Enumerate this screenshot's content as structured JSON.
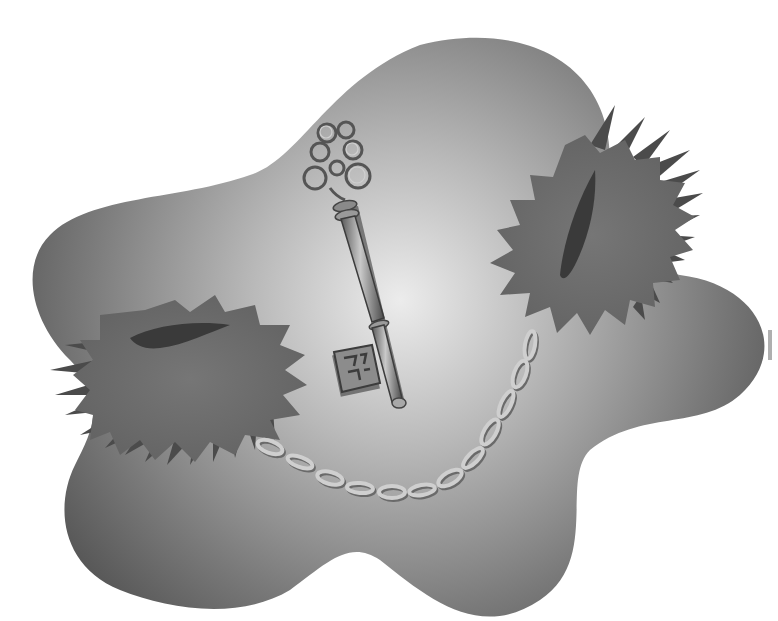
{
  "image": {
    "kind": "grayscale clip-art illustration",
    "width": 778,
    "height": 621,
    "background": "#ffffff"
  },
  "elements": {
    "blob": {
      "name": "gradient-blob",
      "light": "#e6e6e6",
      "mid": "#a6a6a6",
      "dark": "#5a5a5a"
    },
    "key": {
      "name": "skeleton-key",
      "fill": "#8f8f8f",
      "highlight": "#d8d8d8",
      "shadow": "#3c3c3c"
    },
    "hole_left": {
      "name": "spiky-hole-left",
      "fill": "#6e6e6e",
      "spike": "#4a4a4a",
      "slit": "#3a3a3a"
    },
    "hole_right": {
      "name": "spiky-hole-right",
      "fill": "#6e6e6e",
      "spike": "#4a4a4a",
      "slit": "#3a3a3a"
    },
    "chain": {
      "name": "chain",
      "link_count": 12,
      "stroke": "#c8c8c8",
      "shadow": "#6a6a6a"
    }
  }
}
